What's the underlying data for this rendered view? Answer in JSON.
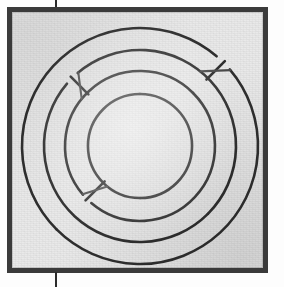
{
  "figure": {
    "kind": "scanned-book-plate",
    "caption": "",
    "label": "",
    "page_marks": {
      "top_tick": "crop-mark",
      "bottom_tick": "crop-mark"
    }
  },
  "colors": {
    "page": "#fdfdfd",
    "plate_background": "#e9e9e9",
    "frame_rule": "#3a3a3a",
    "inner_hairline": "#c9c9c9",
    "ink": "#2e2e2e",
    "ink_light": "#4a4a4a",
    "tick": "#2b2b2b"
  },
  "plate": {
    "left": 7,
    "top": 7,
    "width": 261,
    "height": 266,
    "frame_width": 5
  },
  "crop_marks": [
    {
      "name": "top",
      "x": 55,
      "y": 0,
      "length": 9
    },
    {
      "name": "bottom",
      "x": 55,
      "y": 272,
      "length": 15
    }
  ],
  "chart_data": {
    "type": "line",
    "title": "",
    "xlabel": "",
    "ylabel": "",
    "center": {
      "x": 140,
      "y": 146
    },
    "turn_count": 4,
    "stroke_width": 2.6,
    "rings": [
      {
        "index": 1,
        "name": "ring-inner",
        "radius": 52
      },
      {
        "index": 2,
        "name": "ring-second",
        "radius": 75
      },
      {
        "index": 3,
        "name": "ring-third",
        "radius": 96
      },
      {
        "index": 4,
        "name": "ring-outer",
        "radius": 118
      }
    ],
    "connector_angles_deg": [
      225,
      315,
      45,
      135
    ],
    "connectors": [
      {
        "index": 1,
        "name": "connector-upper-left",
        "angle_deg": 225,
        "from_radius": 52,
        "to_radius": 118
      },
      {
        "index": 2,
        "name": "connector-upper-right",
        "angle_deg": 315,
        "from_radius": 52,
        "to_radius": 118
      },
      {
        "index": 3,
        "name": "connector-lower-right",
        "angle_deg": 45,
        "from_radius": 52,
        "to_radius": 118
      },
      {
        "index": 4,
        "name": "connector-lower-left",
        "angle_deg": 135,
        "from_radius": 52,
        "to_radius": 118
      }
    ],
    "gaps_deg": 9,
    "grid": false,
    "legend": "none"
  }
}
